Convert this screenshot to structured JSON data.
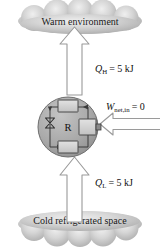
{
  "diagram": {
    "top_cloud": {
      "label": "Warm environment"
    },
    "bottom_cloud": {
      "label": "Cold refrigerated space"
    },
    "heat_out": {
      "symbol": "Q",
      "subscript": "H",
      "equals": "= 5 kJ",
      "full": "QH = 5 kJ"
    },
    "heat_in": {
      "symbol": "Q",
      "subscript": "L",
      "equals": "= 5 kJ",
      "full": "QL = 5 kJ"
    },
    "work_in": {
      "symbol": "W",
      "subscript": "net,in",
      "equals": "= 0",
      "full": "Wnet,in = 0"
    },
    "device": {
      "label": "R",
      "components": {
        "condenser": "condenser-box",
        "evaporator": "evaporator-box",
        "compressor": "compressor-box",
        "expansion_valve": "expansion-valve"
      }
    },
    "colors": {
      "cloud_fill": "#b0b0b0",
      "cloud_fill_light": "#d8d8d8",
      "circle_fill": "#a8a8a8",
      "circle_stroke": "#555555",
      "box_fill": "#d2d2d2",
      "arrow_fill": "#ffffff",
      "arrow_stroke": "#9a9a9a",
      "line": "#3a3a3a",
      "text": "#111111"
    }
  }
}
